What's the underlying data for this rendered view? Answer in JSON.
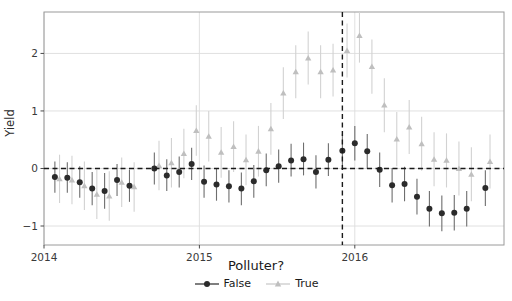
{
  "chart_data": {
    "type": "scatter",
    "title": "",
    "xlabel": "",
    "ylabel": "Yield",
    "xlim": [
      2014.0,
      2016.96
    ],
    "ylim": [
      -1.33,
      2.72
    ],
    "xticks": [
      2014,
      2015,
      2016
    ],
    "xtick_labels": [
      "2014",
      "2015",
      "2016"
    ],
    "yticks": [
      -1,
      0,
      1,
      2
    ],
    "ytick_labels": [
      "−1",
      "0",
      "1",
      "2"
    ],
    "grid": true,
    "grid_axis": "both",
    "legend_title": "Polluter?",
    "legend_position": "below-axes",
    "hline": 0,
    "hline_style": "dashed",
    "vline": 2015.92,
    "vline_style": "dashed",
    "series": [
      {
        "name": "False",
        "marker": "circle",
        "color": "#2b2b2b",
        "points": [
          {
            "x": 2014.07,
            "y": -0.15,
            "lo": -0.42,
            "hi": 0.12
          },
          {
            "x": 2014.15,
            "y": -0.16,
            "lo": -0.42,
            "hi": 0.11
          },
          {
            "x": 2014.23,
            "y": -0.24,
            "lo": -0.51,
            "hi": 0.04
          },
          {
            "x": 2014.31,
            "y": -0.35,
            "lo": -0.64,
            "hi": -0.06
          },
          {
            "x": 2014.39,
            "y": -0.39,
            "lo": -0.7,
            "hi": -0.08
          },
          {
            "x": 2014.47,
            "y": -0.2,
            "lo": -0.48,
            "hi": 0.08
          },
          {
            "x": 2014.55,
            "y": -0.3,
            "lo": -0.58,
            "hi": -0.02
          },
          {
            "x": 2014.71,
            "y": 0.0,
            "lo": -0.28,
            "hi": 0.28
          },
          {
            "x": 2014.79,
            "y": -0.12,
            "lo": -0.39,
            "hi": 0.16
          },
          {
            "x": 2014.87,
            "y": -0.06,
            "lo": -0.33,
            "hi": 0.21
          },
          {
            "x": 2014.95,
            "y": 0.08,
            "lo": -0.2,
            "hi": 0.36
          },
          {
            "x": 2015.03,
            "y": -0.23,
            "lo": -0.51,
            "hi": 0.05
          },
          {
            "x": 2015.11,
            "y": -0.28,
            "lo": -0.56,
            "hi": 0.0
          },
          {
            "x": 2015.19,
            "y": -0.31,
            "lo": -0.59,
            "hi": -0.03
          },
          {
            "x": 2015.27,
            "y": -0.35,
            "lo": -0.64,
            "hi": -0.07
          },
          {
            "x": 2015.35,
            "y": -0.22,
            "lo": -0.51,
            "hi": 0.06
          },
          {
            "x": 2015.43,
            "y": -0.03,
            "lo": -0.31,
            "hi": 0.26
          },
          {
            "x": 2015.51,
            "y": 0.04,
            "lo": -0.25,
            "hi": 0.33
          },
          {
            "x": 2015.59,
            "y": 0.14,
            "lo": -0.14,
            "hi": 0.43
          },
          {
            "x": 2015.67,
            "y": 0.16,
            "lo": -0.12,
            "hi": 0.45
          },
          {
            "x": 2015.75,
            "y": -0.06,
            "lo": -0.35,
            "hi": 0.23
          },
          {
            "x": 2015.83,
            "y": 0.15,
            "lo": -0.13,
            "hi": 0.44
          },
          {
            "x": 2015.92,
            "y": 0.31,
            "lo": 0.02,
            "hi": 0.6
          },
          {
            "x": 2016.0,
            "y": 0.44,
            "lo": 0.14,
            "hi": 0.74
          },
          {
            "x": 2016.08,
            "y": 0.3,
            "lo": 0.0,
            "hi": 0.6
          },
          {
            "x": 2016.16,
            "y": -0.02,
            "lo": -0.32,
            "hi": 0.28
          },
          {
            "x": 2016.24,
            "y": -0.29,
            "lo": -0.59,
            "hi": 0.01
          },
          {
            "x": 2016.32,
            "y": -0.27,
            "lo": -0.57,
            "hi": 0.03
          },
          {
            "x": 2016.4,
            "y": -0.49,
            "lo": -0.8,
            "hi": -0.18
          },
          {
            "x": 2016.48,
            "y": -0.7,
            "lo": -1.01,
            "hi": -0.39
          },
          {
            "x": 2016.56,
            "y": -0.78,
            "lo": -1.09,
            "hi": -0.47
          },
          {
            "x": 2016.64,
            "y": -0.77,
            "lo": -1.08,
            "hi": -0.46
          },
          {
            "x": 2016.72,
            "y": -0.7,
            "lo": -1.01,
            "hi": -0.39
          },
          {
            "x": 2016.84,
            "y": -0.34,
            "lo": -0.65,
            "hi": -0.03
          }
        ]
      },
      {
        "name": "True",
        "marker": "triangle",
        "color": "#bfbfbf",
        "points": [
          {
            "x": 2014.1,
            "y": -0.18,
            "lo": -0.6,
            "hi": 0.24
          },
          {
            "x": 2014.18,
            "y": -0.2,
            "lo": -0.62,
            "hi": 0.22
          },
          {
            "x": 2014.26,
            "y": -0.3,
            "lo": -0.72,
            "hi": 0.12
          },
          {
            "x": 2014.34,
            "y": -0.45,
            "lo": -0.88,
            "hi": -0.02
          },
          {
            "x": 2014.42,
            "y": -0.48,
            "lo": -0.91,
            "hi": -0.05
          },
          {
            "x": 2014.5,
            "y": -0.24,
            "lo": -0.67,
            "hi": 0.19
          },
          {
            "x": 2014.58,
            "y": -0.32,
            "lo": -0.75,
            "hi": 0.11
          },
          {
            "x": 2014.74,
            "y": 0.05,
            "lo": -0.38,
            "hi": 0.48
          },
          {
            "x": 2014.82,
            "y": 0.1,
            "lo": -0.33,
            "hi": 0.53
          },
          {
            "x": 2014.9,
            "y": 0.26,
            "lo": -0.17,
            "hi": 0.69
          },
          {
            "x": 2014.98,
            "y": 0.66,
            "lo": 0.22,
            "hi": 1.1
          },
          {
            "x": 2015.06,
            "y": 0.56,
            "lo": 0.12,
            "hi": 1.0
          },
          {
            "x": 2015.14,
            "y": 0.28,
            "lo": -0.16,
            "hi": 0.72
          },
          {
            "x": 2015.22,
            "y": 0.38,
            "lo": -0.06,
            "hi": 0.82
          },
          {
            "x": 2015.3,
            "y": 0.15,
            "lo": -0.29,
            "hi": 0.59
          },
          {
            "x": 2015.38,
            "y": 0.3,
            "lo": -0.14,
            "hi": 0.74
          },
          {
            "x": 2015.46,
            "y": 0.69,
            "lo": 0.24,
            "hi": 1.14
          },
          {
            "x": 2015.54,
            "y": 1.31,
            "lo": 0.86,
            "hi": 1.76
          },
          {
            "x": 2015.62,
            "y": 1.68,
            "lo": 1.22,
            "hi": 2.14
          },
          {
            "x": 2015.7,
            "y": 1.92,
            "lo": 1.46,
            "hi": 2.38
          },
          {
            "x": 2015.78,
            "y": 1.68,
            "lo": 1.22,
            "hi": 2.14
          },
          {
            "x": 2015.86,
            "y": 1.71,
            "lo": 1.25,
            "hi": 2.17
          },
          {
            "x": 2015.95,
            "y": 2.05,
            "lo": 1.58,
            "hi": 2.52
          },
          {
            "x": 2016.03,
            "y": 2.31,
            "lo": 1.84,
            "hi": 2.78
          },
          {
            "x": 2016.11,
            "y": 1.77,
            "lo": 1.3,
            "hi": 2.24
          },
          {
            "x": 2016.19,
            "y": 1.1,
            "lo": 0.63,
            "hi": 1.57
          },
          {
            "x": 2016.27,
            "y": 0.51,
            "lo": 0.04,
            "hi": 0.98
          },
          {
            "x": 2016.35,
            "y": 0.72,
            "lo": 0.25,
            "hi": 1.19
          },
          {
            "x": 2016.43,
            "y": 0.43,
            "lo": -0.04,
            "hi": 0.9
          },
          {
            "x": 2016.51,
            "y": 0.16,
            "lo": -0.31,
            "hi": 0.63
          },
          {
            "x": 2016.59,
            "y": 0.14,
            "lo": -0.33,
            "hi": 0.61
          },
          {
            "x": 2016.67,
            "y": 0.0,
            "lo": -0.47,
            "hi": 0.47
          },
          {
            "x": 2016.75,
            "y": -0.1,
            "lo": -0.57,
            "hi": 0.37
          },
          {
            "x": 2016.87,
            "y": 0.12,
            "lo": -0.35,
            "hi": 0.59
          }
        ]
      }
    ]
  },
  "axes": {
    "ylabel": "Yield"
  },
  "legend": {
    "title": "Polluter?",
    "entries": [
      {
        "label": "False",
        "marker": "circle",
        "color": "#2b2b2b"
      },
      {
        "label": "True",
        "marker": "triangle",
        "color": "#bfbfbf"
      }
    ]
  },
  "colors": {
    "false_series": "#2b2b2b",
    "true_series": "#bfbfbf",
    "grid": "#dcdcdc",
    "frame": "#9a9a9a",
    "text": "#2b2b2b"
  }
}
